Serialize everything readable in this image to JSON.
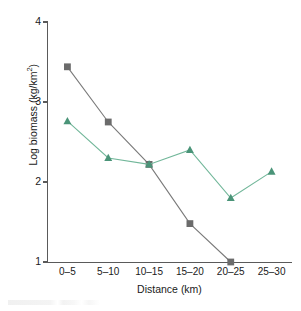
{
  "chart_data": {
    "type": "line",
    "title": "",
    "xlabel": "Distance (km)",
    "ylabel": "Log biomass (kg/km²)",
    "ylabel_base": "Log biomass (kg/km",
    "ylabel_sup": "2",
    "ylabel_close": ")",
    "categories": [
      "0–5",
      "5–10",
      "10–15",
      "15–20",
      "20–25",
      "25–30"
    ],
    "ylim": [
      1,
      4
    ],
    "yticks": [
      1,
      2,
      3,
      4
    ],
    "ytick_labels": [
      "1",
      "2",
      "3",
      "4"
    ],
    "grid": false,
    "legend": "none",
    "series": [
      {
        "name": "gray-series",
        "marker": "square",
        "color": "#6b6b6b",
        "line_color": "#7a7a7a",
        "values": [
          3.44,
          2.75,
          2.22,
          1.48,
          1.0,
          null
        ]
      },
      {
        "name": "green-series",
        "marker": "triangle",
        "color": "#4a9478",
        "line_color": "#72b79a",
        "values": [
          2.76,
          2.3,
          2.22,
          2.4,
          1.8,
          2.13
        ]
      }
    ]
  },
  "figure": {
    "axis_color": "#5a5a5a",
    "background": "#ffffff"
  }
}
